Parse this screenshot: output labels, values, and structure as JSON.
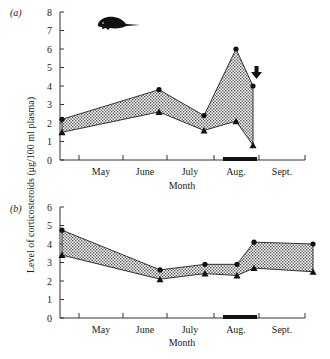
{
  "chart_data": [
    {
      "type": "area",
      "panel_label": "(a)",
      "title": "",
      "xlabel": "Month",
      "ylabel": "Level of corticosteroids (μg/100 ml plasma)",
      "ylim": [
        0,
        8
      ],
      "yticks": [
        0,
        1,
        2,
        3,
        4,
        5,
        6,
        7,
        8
      ],
      "x_tick_labels": [
        "May",
        "June",
        "July",
        "Aug.",
        "Sept."
      ],
      "grid": false,
      "legend": null,
      "annotations": [
        "mouse/marsupial silhouette icon",
        "down arrow above final upper point in Aug.",
        "black bar on x-axis spanning Aug."
      ],
      "x": [
        "Apr. end",
        "June",
        "July",
        "Aug. (mid)",
        "Aug. (late)"
      ],
      "series": [
        {
          "name": "upper (circles)",
          "marker": "circle",
          "values": [
            2.2,
            3.8,
            2.4,
            6.0,
            4.0
          ]
        },
        {
          "name": "lower (triangles)",
          "marker": "triangle",
          "values": [
            1.5,
            2.6,
            1.6,
            2.1,
            0.8
          ]
        }
      ]
    },
    {
      "type": "area",
      "panel_label": "(b)",
      "title": "",
      "xlabel": "Month",
      "ylabel": "Level of corticosteroids (μg/100 ml plasma)",
      "ylim": [
        0,
        6
      ],
      "yticks": [
        0,
        1,
        2,
        3,
        4,
        5,
        6
      ],
      "x_tick_labels": [
        "May",
        "June",
        "July",
        "Aug.",
        "Sept."
      ],
      "grid": false,
      "legend": null,
      "annotations": [
        "black bar on x-axis spanning Aug."
      ],
      "x": [
        "Apr. end",
        "June",
        "July",
        "Aug. (mid)",
        "Aug. (late)",
        "Sept. end"
      ],
      "series": [
        {
          "name": "upper (circles)",
          "marker": "circle",
          "values": [
            4.75,
            2.6,
            2.9,
            2.9,
            4.1,
            4.0
          ]
        },
        {
          "name": "lower (triangles)",
          "marker": "triangle",
          "values": [
            3.4,
            2.1,
            2.4,
            2.3,
            2.7,
            2.5
          ]
        }
      ]
    }
  ],
  "labels": {
    "panel_a": "(a)",
    "panel_b": "(b)",
    "ylabel": "Level of corticosteroids (μg/100 ml plasma)",
    "xlabel_a": "Month",
    "xlabel_b": "Month",
    "months": [
      "May",
      "June",
      "July",
      "Aug.",
      "Sept."
    ],
    "yticks_a": [
      "0",
      "1",
      "2",
      "3",
      "4",
      "5",
      "6",
      "7",
      "8"
    ],
    "yticks_b": [
      "0",
      "1",
      "2",
      "3",
      "4",
      "5",
      "6"
    ]
  }
}
